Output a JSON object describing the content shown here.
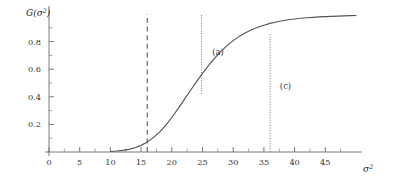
{
  "chart_data": {
    "type": "line",
    "title": "",
    "subtitle": "",
    "xlabel": "σ²",
    "ylabel": "G(σ²)",
    "xlim": [
      0,
      50
    ],
    "ylim": [
      0,
      1.0
    ],
    "grid": false,
    "legend": null,
    "x_major_ticks": [
      0,
      5,
      10,
      15,
      20,
      25,
      30,
      35,
      40,
      45
    ],
    "x_tick_labels": [
      "0",
      "5",
      "10",
      "15",
      "20",
      "25",
      "30",
      "35",
      "40",
      "45"
    ],
    "x_minor_tick_step": 2.5,
    "y_major_ticks": [
      0.2,
      0.4,
      0.6,
      0.8
    ],
    "y_tick_labels": [
      "0.2",
      "0.4",
      "0.6",
      "0.8"
    ],
    "y_minor_tick_step": 0.1,
    "series": [
      {
        "name": "G(σ²)",
        "color": "#555555",
        "style": "solid",
        "x": [
          10.0,
          11.0,
          12.0,
          13.0,
          14.0,
          15.0,
          16.0,
          17.0,
          18.0,
          19.0,
          20.0,
          21.0,
          22.0,
          23.0,
          24.0,
          25.0,
          26.0,
          27.0,
          28.0,
          29.0,
          30.0,
          31.0,
          32.0,
          33.0,
          34.0,
          35.0,
          36.0,
          37.0,
          38.0,
          39.0,
          40.0,
          41.0,
          42.0,
          43.0,
          44.0,
          45.0,
          46.0,
          47.0,
          48.0,
          49.0,
          50.0
        ],
        "y": [
          0.004,
          0.007,
          0.012,
          0.019,
          0.031,
          0.048,
          0.072,
          0.104,
          0.144,
          0.193,
          0.25,
          0.312,
          0.378,
          0.444,
          0.508,
          0.57,
          0.628,
          0.681,
          0.729,
          0.771,
          0.807,
          0.838,
          0.864,
          0.886,
          0.904,
          0.919,
          0.932,
          0.942,
          0.951,
          0.958,
          0.964,
          0.969,
          0.973,
          0.976,
          0.979,
          0.981,
          0.983,
          0.985,
          0.986,
          0.988,
          0.989
        ]
      }
    ],
    "markers": [
      {
        "id": "threshold",
        "label": "",
        "type": "vline",
        "x": 16.0,
        "style": "dashed",
        "color": "#5a5a5a",
        "y_from": 0.0,
        "y_to": 1.0
      },
      {
        "id": "a",
        "label": "(a)",
        "type": "vline",
        "x": 24.85,
        "style": "dotted",
        "color": "#7d7d7d",
        "y_from": 0.42,
        "y_to": 1.0,
        "label_x": 26.6,
        "label_y": 0.7
      },
      {
        "id": "c",
        "label": "(c)",
        "type": "vline",
        "x": 36.0,
        "style": "dotted",
        "color": "#7d7d7d",
        "y_from": 0.0,
        "y_to": 0.855,
        "label_x": 37.6,
        "label_y": 0.46
      }
    ],
    "annotations": [
      {
        "text": "(a)",
        "x": 26.6,
        "y": 0.7
      },
      {
        "text": "(c)",
        "x": 37.6,
        "y": 0.46
      }
    ]
  },
  "axis": {
    "y_title_base": "G(σ",
    "y_title_sup": "2",
    "y_title_close": ")",
    "x_title_base": "σ",
    "x_title_sup": "2"
  },
  "colors": {
    "curve": "#555555",
    "axis": "#6b6b6b",
    "dashed_marker": "#5a5a5a",
    "dotted_marker": "#7d7d7d",
    "text": "#333333",
    "background": "#ffffff"
  }
}
